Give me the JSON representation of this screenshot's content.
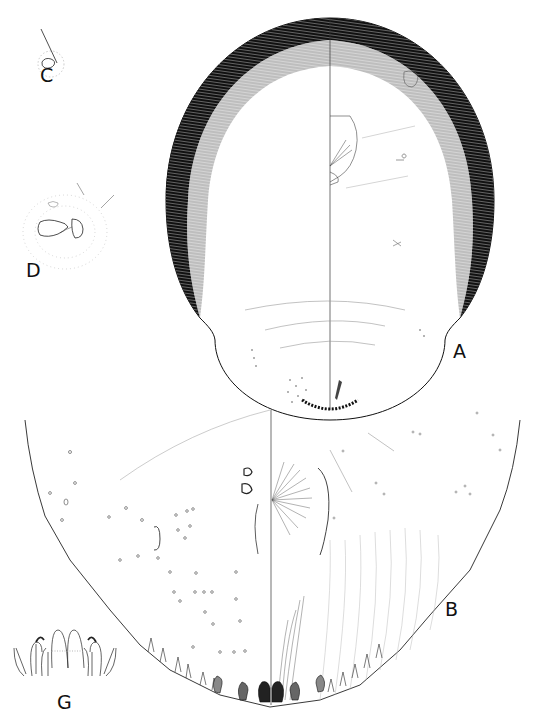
{
  "plate": {
    "type": "scientific-illustration",
    "subject": "scale insect morphology plate",
    "background": "#ffffff",
    "ink": "#111111"
  },
  "figures": [
    {
      "id": "A",
      "label": "A",
      "description": "whole adult female, dorsal/ventral halves divided by midline, heavily stippled sclerotized margin"
    },
    {
      "id": "B",
      "label": "B",
      "description": "pygidium enlarged, divided by midline, lobes and plates at apex"
    },
    {
      "id": "C",
      "label": "C",
      "description": "dorsal seta with pore, detail"
    },
    {
      "id": "D",
      "label": "D",
      "description": "spiracle with surrounding pores, detail"
    },
    {
      "id": "G",
      "label": "G",
      "description": "median pygidial lobes and plates, detail"
    }
  ],
  "labels": {
    "a": "A",
    "b": "B",
    "c": "C",
    "d": "D",
    "g": "G"
  }
}
